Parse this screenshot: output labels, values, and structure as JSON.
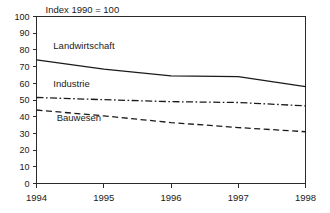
{
  "chart_data": {
    "type": "line",
    "title": "",
    "note": "Index 1990 = 100",
    "xlabel": "",
    "ylabel": "",
    "x": [
      1994,
      1995,
      1996,
      1997,
      1998
    ],
    "xtick_labels": [
      "1994",
      "1995",
      "1996",
      "1997",
      "1998"
    ],
    "ytick_labels": [
      "0",
      "10",
      "20",
      "30",
      "40",
      "50",
      "60",
      "70",
      "80",
      "90",
      "100"
    ],
    "yticks": [
      0,
      10,
      20,
      30,
      40,
      50,
      60,
      70,
      80,
      90,
      100
    ],
    "xlim": [
      1994,
      1998
    ],
    "ylim": [
      0,
      100
    ],
    "grid": false,
    "legend": "inline-labels",
    "series": [
      {
        "name": "Landwirtschaft",
        "style": "solid",
        "values": [
          74,
          68.5,
          64.5,
          64,
          58
        ],
        "label_x": 1994.25,
        "label_y": 80.5
      },
      {
        "name": "Industrie",
        "style": "dash-dot",
        "values": [
          51.5,
          50.2,
          49,
          48.5,
          46.5
        ],
        "label_x": 1994.25,
        "label_y": 57.5
      },
      {
        "name": "Bauwesen",
        "style": "dashed",
        "values": [
          44,
          40.5,
          36.5,
          33.5,
          31
        ],
        "label_x": 1994.3,
        "label_y": 37.5
      }
    ]
  },
  "colors": {
    "background": "#ffffff",
    "axis": "#2a2a2a",
    "line": "#1a1a1a",
    "text": "#1a1a1a"
  }
}
